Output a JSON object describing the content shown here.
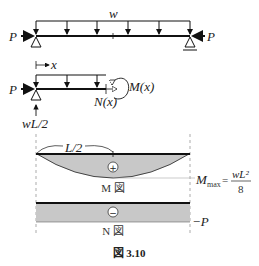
{
  "beam": {
    "load_label": "w",
    "left_force_label": "P",
    "right_force_label": "P"
  },
  "free_body": {
    "x_label": "x",
    "left_force_label": "P",
    "moment_label": "M(x)",
    "axial_label": "N(x)",
    "reaction_label": "wL/2"
  },
  "moment_diagram": {
    "half_span_label": "L/2",
    "sign": "+",
    "name": "M 図",
    "max_label": "M",
    "max_subscript": "max",
    "max_eq": "=",
    "max_numerator": "wL²",
    "max_denominator": "8",
    "fill_color": "#c8c8c8"
  },
  "axial_diagram": {
    "sign": "−",
    "name": "N 図",
    "value_label": "−P",
    "fill_color": "#c8c8c8"
  },
  "caption": "図 3.10"
}
